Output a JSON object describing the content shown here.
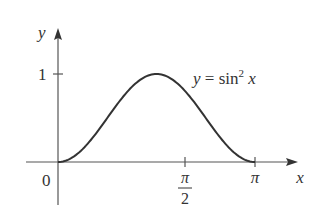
{
  "chart_data": {
    "type": "line",
    "title": "",
    "function_label": "y = sin² x",
    "function_label_parts": {
      "lhs": "y",
      "eq": " = sin",
      "sup": "2",
      "var": " x"
    },
    "xlabel": "x",
    "ylabel": "y",
    "x_ticks": [
      {
        "value": 0,
        "label": "0"
      },
      {
        "value": 1.5708,
        "label_num": "π",
        "label_den": "2"
      },
      {
        "value": 3.1416,
        "label": "π"
      }
    ],
    "y_ticks": [
      {
        "value": 1,
        "label": "1"
      }
    ],
    "xlim": [
      -0.45,
      3.9
    ],
    "ylim": [
      -0.35,
      1.6
    ],
    "grid": false,
    "series": [
      {
        "name": "y = sin^2 x",
        "x": [
          0,
          0.3927,
          0.7854,
          1.1781,
          1.5708,
          1.9635,
          2.3562,
          2.7489,
          3.1416
        ],
        "y": [
          0,
          0.1464,
          0.5,
          0.8536,
          1,
          0.8536,
          0.5,
          0.1464,
          0
        ]
      }
    ],
    "color": "#333333"
  }
}
